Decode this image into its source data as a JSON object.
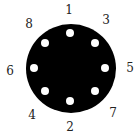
{
  "colors": {
    "disc": "#000000",
    "hole": "#ffffff",
    "label": "#222222"
  },
  "holes": [
    {
      "x": 70,
      "y": 33
    },
    {
      "x": 95,
      "y": 43
    },
    {
      "x": 105,
      "y": 68
    },
    {
      "x": 95,
      "y": 91
    },
    {
      "x": 70,
      "y": 101
    },
    {
      "x": 45,
      "y": 91
    },
    {
      "x": 34,
      "y": 68
    },
    {
      "x": 45,
      "y": 43
    }
  ],
  "labels": [
    {
      "text": "1",
      "x": 64,
      "y": 4
    },
    {
      "text": "3",
      "x": 101,
      "y": 14
    },
    {
      "text": "5",
      "x": 125,
      "y": 62
    },
    {
      "text": "7",
      "x": 108,
      "y": 107
    },
    {
      "text": "2",
      "x": 65,
      "y": 121
    },
    {
      "text": "4",
      "x": 27,
      "y": 109
    },
    {
      "text": "6",
      "x": 5,
      "y": 65
    },
    {
      "text": "8",
      "x": 24,
      "y": 18
    }
  ]
}
